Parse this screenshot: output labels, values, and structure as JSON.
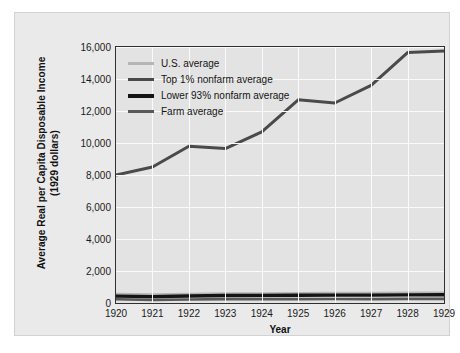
{
  "chart_data": {
    "type": "line",
    "title": "",
    "xlabel": "Year",
    "ylabel": "Average Real per Capita Disposable Income (1929 dollars)",
    "ylabel_line1": "Average Real per Capita Disposable Income",
    "ylabel_line2": "(1929 dollars)",
    "x": [
      1920,
      1921,
      1922,
      1923,
      1924,
      1925,
      1926,
      1927,
      1928,
      1929
    ],
    "categories": [
      "1920",
      "1921",
      "1922",
      "1923",
      "1924",
      "1925",
      "1926",
      "1927",
      "1928",
      "1929"
    ],
    "xlim": [
      1920,
      1929
    ],
    "ylim": [
      0,
      16000
    ],
    "yticks": [
      0,
      2000,
      4000,
      6000,
      8000,
      10000,
      12000,
      14000,
      16000
    ],
    "ytick_labels": [
      "0",
      "2,000",
      "4,000",
      "6,000",
      "8,000",
      "10,000",
      "12,000",
      "14,000",
      "16,000"
    ],
    "grid": true,
    "legend_position": "upper-left-inside",
    "series": [
      {
        "name": "U.S. average",
        "color": "#b5b5b5",
        "width": 2.2,
        "values": [
          570,
          540,
          575,
          610,
          605,
          620,
          635,
          630,
          645,
          655
        ]
      },
      {
        "name": "Top 1% nonfarm average",
        "color": "#4a4a4a",
        "width": 3.0,
        "values": [
          8000,
          8500,
          9800,
          9650,
          10700,
          12700,
          12500,
          13600,
          15650,
          15750
        ]
      },
      {
        "name": "Lower 93% nonfarm average",
        "color": "#141414",
        "width": 3.4,
        "values": [
          430,
          400,
          440,
          470,
          465,
          480,
          495,
          490,
          505,
          515
        ]
      },
      {
        "name": "Farm average",
        "color": "#595959",
        "width": 2.6,
        "values": [
          230,
          195,
          215,
          240,
          235,
          245,
          250,
          245,
          255,
          260
        ]
      }
    ]
  },
  "legend": {
    "items": [
      {
        "label": "U.S. average",
        "color": "#b5b5b5",
        "thickness": "3px"
      },
      {
        "label": "Top 1% nonfarm average",
        "color": "#4a4a4a",
        "thickness": "3px"
      },
      {
        "label": "Lower 93% nonfarm average",
        "color": "#141414",
        "thickness": "4px"
      },
      {
        "label": "Farm average",
        "color": "#595959",
        "thickness": "3px"
      }
    ]
  },
  "axes": {
    "x_title": "Year",
    "y_title_line1": "Average Real per Capita Disposable Income",
    "y_title_line2": "(1929 dollars)"
  },
  "colors": {
    "page_background": "#ffffff",
    "card_background": "#eaeaea",
    "plot_background": "#e3e3e3",
    "gridline": "#fbfbfb",
    "frame": "#2f2f2f",
    "text": "#1a1a1a"
  }
}
